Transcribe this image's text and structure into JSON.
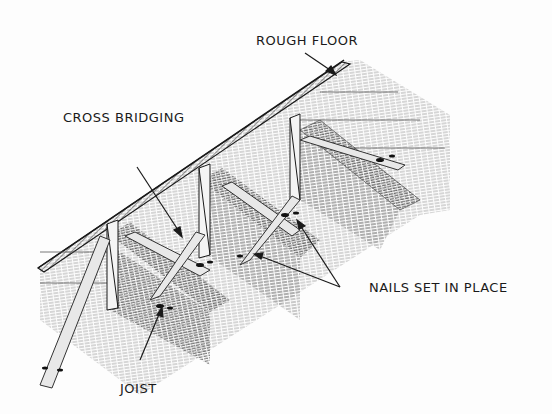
{
  "diagram": {
    "labels": {
      "rough_floor": "ROUGH FLOOR",
      "cross_bridging": "CROSS BRIDGING",
      "nails": "NAILS SET IN PLACE",
      "joist": "JOIST"
    },
    "colors": {
      "ink": "#1a1a1a",
      "shade": "#777777",
      "background": "#fdfdfd"
    }
  }
}
